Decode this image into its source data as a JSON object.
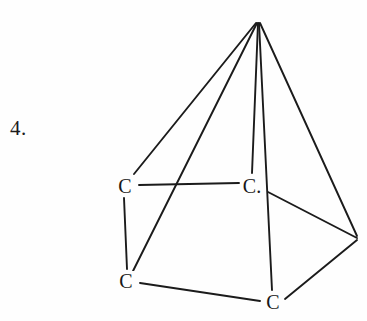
{
  "page": {
    "background_color": "#fefefe",
    "ink_color": "#1b1b1b",
    "width": 367,
    "height": 321
  },
  "question": {
    "number_label": "4."
  },
  "figure": {
    "name": "carbon-skeleton-pyramid",
    "stroke_color": "#1b1b1b",
    "stroke_width": 1.9,
    "vertices": [
      {
        "id": "apex",
        "x": 258,
        "y": 22,
        "label": ""
      },
      {
        "id": "upper-left",
        "x": 125,
        "y": 186,
        "label": "C"
      },
      {
        "id": "upper-middle",
        "x": 252,
        "y": 186,
        "label": "C."
      },
      {
        "id": "bottom-left",
        "x": 126,
        "y": 281,
        "label": "C"
      },
      {
        "id": "bottom-right",
        "x": 273,
        "y": 302,
        "label": "C"
      },
      {
        "id": "right",
        "x": 358,
        "y": 238,
        "label": ""
      }
    ],
    "bonds": [
      {
        "from": "apex",
        "to": "upper-left",
        "x1": 256,
        "y1": 23,
        "x2": 134,
        "y2": 174
      },
      {
        "from": "apex",
        "to": "bottom-left",
        "x1": 257,
        "y1": 23,
        "x2": 133,
        "y2": 271
      },
      {
        "from": "apex",
        "to": "upper-middle",
        "x1": 258,
        "y1": 23,
        "x2": 252,
        "y2": 173
      },
      {
        "from": "apex",
        "to": "bottom-right",
        "x1": 259,
        "y1": 23,
        "x2": 272,
        "y2": 290
      },
      {
        "from": "apex",
        "to": "right",
        "x1": 260,
        "y1": 23,
        "x2": 357,
        "y2": 236
      },
      {
        "from": "upper-left",
        "to": "upper-middle",
        "x1": 139,
        "y1": 185,
        "x2": 239,
        "y2": 183
      },
      {
        "from": "upper-left",
        "to": "bottom-left",
        "x1": 124,
        "y1": 198,
        "x2": 127,
        "y2": 269
      },
      {
        "from": "bottom-left",
        "to": "bottom-right",
        "x1": 140,
        "y1": 283,
        "x2": 260,
        "y2": 301
      },
      {
        "from": "upper-middle",
        "to": "right",
        "x1": 268,
        "y1": 192,
        "x2": 357,
        "y2": 238
      },
      {
        "from": "right",
        "to": "bottom-right",
        "x1": 357,
        "y1": 240,
        "x2": 285,
        "y2": 299
      }
    ]
  }
}
